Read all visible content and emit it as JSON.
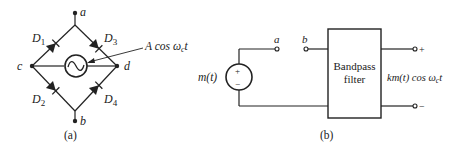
{
  "figure_a": {
    "caption": "(a)",
    "nodes": {
      "a": "a",
      "b": "b",
      "c": "c",
      "d": "d"
    },
    "diodes": [
      {
        "name": "D",
        "sub": "1"
      },
      {
        "name": "D",
        "sub": "3"
      },
      {
        "name": "D",
        "sub": "2"
      },
      {
        "name": "D",
        "sub": "4"
      }
    ],
    "source_label": {
      "prefix": "A cos ω",
      "sub": "c",
      "suffix": "t"
    },
    "source_symbol": "~"
  },
  "figure_b": {
    "caption": "(b)",
    "terminal_a": "a",
    "terminal_b": "b",
    "source_label": "m(t)",
    "source_plus": "+",
    "source_minus": "−",
    "filter_line1": "Bandpass",
    "filter_line2": "filter",
    "output_label": {
      "prefix": "km(t) cos ω",
      "sub": "c",
      "suffix": "t"
    },
    "output_plus": "+",
    "output_minus": "−"
  },
  "colors": {
    "line": "#222222",
    "background": "#ffffff"
  }
}
